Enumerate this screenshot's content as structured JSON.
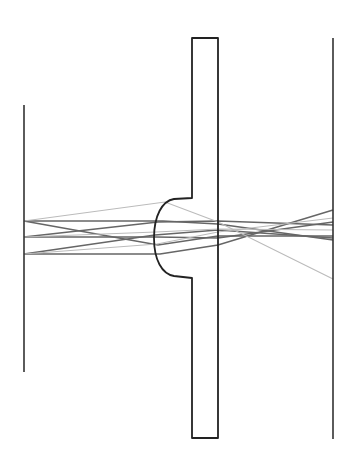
{
  "diagram": {
    "type": "optical-ray-trace",
    "colors": {
      "background": "#ffffff",
      "outline": "#222222",
      "ray_dark": "#666666",
      "ray_light": "#bbbbbb"
    },
    "object_plane": {
      "x": 24,
      "y1": 105,
      "y2": 372
    },
    "image_plane": {
      "x": 333,
      "y1": 38,
      "y2": 439
    },
    "lens_plate": {
      "left_x": 192,
      "right_x": 218,
      "top_y": 38,
      "bottom_y": 438,
      "lens_vertex_x": 154,
      "lens_top_y": 199,
      "lens_bottom_y": 277
    },
    "rays": [
      {
        "kind": "dark",
        "points": [
          [
            24,
            221
          ],
          [
            163,
            221
          ],
          [
            218,
            224
          ],
          [
            333,
            240
          ]
        ]
      },
      {
        "kind": "dark",
        "points": [
          [
            24,
            237
          ],
          [
            158,
            222
          ],
          [
            218,
            221
          ],
          [
            333,
            225
          ]
        ]
      },
      {
        "kind": "dark",
        "points": [
          [
            24,
            254
          ],
          [
            160,
            254
          ],
          [
            218,
            245
          ],
          [
            333,
            210
          ]
        ]
      },
      {
        "kind": "dark",
        "points": [
          [
            24,
            237
          ],
          [
            156,
            237
          ],
          [
            218,
            238
          ],
          [
            333,
            222
          ]
        ]
      },
      {
        "kind": "dark",
        "points": [
          [
            24,
            221
          ],
          [
            158,
            245
          ],
          [
            218,
            236
          ],
          [
            333,
            236
          ]
        ]
      },
      {
        "kind": "dark",
        "points": [
          [
            24,
            254
          ],
          [
            155,
            235
          ],
          [
            218,
            230
          ],
          [
            333,
            238
          ]
        ]
      },
      {
        "kind": "light",
        "points": [
          [
            24,
            221
          ],
          [
            165,
            202
          ],
          [
            218,
            222
          ],
          [
            333,
            279
          ]
        ]
      },
      {
        "kind": "light",
        "points": [
          [
            24,
            237
          ],
          [
            156,
            232
          ],
          [
            218,
            229
          ],
          [
            333,
            230
          ]
        ]
      },
      {
        "kind": "light",
        "points": [
          [
            24,
            254
          ],
          [
            157,
            244
          ],
          [
            218,
            232
          ],
          [
            333,
            218
          ]
        ]
      }
    ]
  }
}
